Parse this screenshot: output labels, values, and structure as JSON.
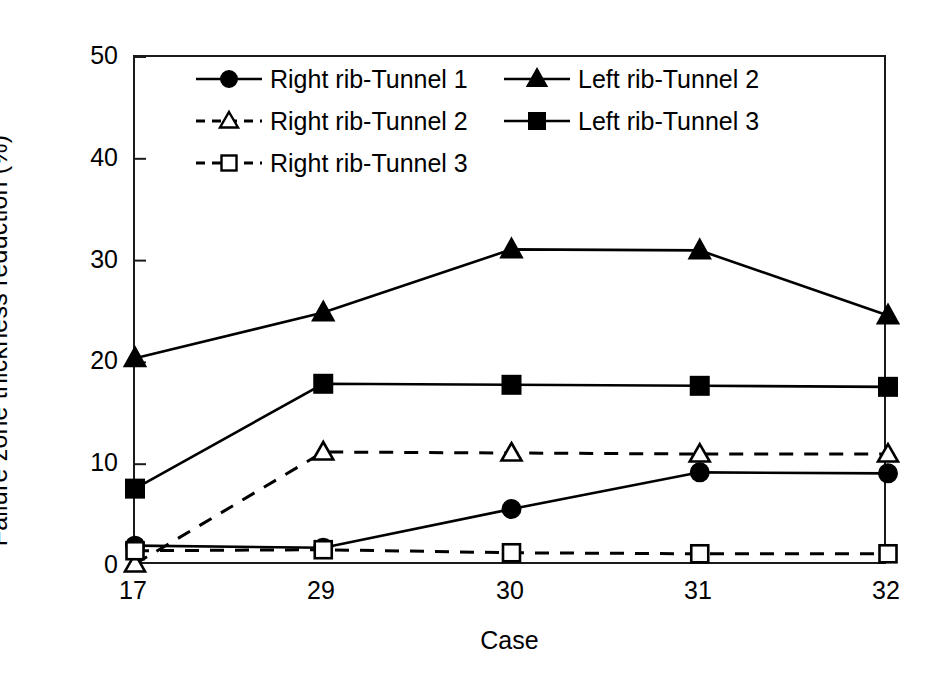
{
  "chart_data": {
    "type": "line",
    "title": "",
    "xlabel": "Case",
    "ylabel": "Failure zone thickness reduction  (%)",
    "categories": [
      "17",
      "29",
      "30",
      "31",
      "32"
    ],
    "xticklabels": [
      "17",
      "29",
      "30",
      "31",
      "32"
    ],
    "yticklabels": [
      "0",
      "10",
      "20",
      "30",
      "40",
      "50"
    ],
    "yticks": [
      0,
      10,
      20,
      30,
      40,
      50
    ],
    "ylim": [
      0,
      50
    ],
    "xlim": [
      0,
      4
    ],
    "grid": false,
    "legend_position": "upper-left-inside",
    "series": [
      {
        "name": "Right rib-Tunnel 1",
        "marker": "filled-circle",
        "linestyle": "solid",
        "color": "#000000",
        "values": [
          2.0,
          1.8,
          5.6,
          9.2,
          9.1
        ]
      },
      {
        "name": "Right rib-Tunnel 2",
        "marker": "open-triangle",
        "linestyle": "dashed",
        "color": "#000000",
        "values": [
          0.2,
          11.2,
          11.1,
          11.0,
          11.0
        ]
      },
      {
        "name": "Right rib-Tunnel 3",
        "marker": "open-square",
        "linestyle": "dashed",
        "color": "#000000",
        "values": [
          1.5,
          1.6,
          1.3,
          1.2,
          1.2
        ]
      },
      {
        "name": "Left rib-Tunnel 2",
        "marker": "filled-triangle",
        "linestyle": "solid",
        "color": "#000000",
        "values": [
          20.4,
          24.9,
          31.1,
          31.0,
          24.6
        ]
      },
      {
        "name": "Left rib-Tunnel 3",
        "marker": "filled-square",
        "linestyle": "solid",
        "color": "#000000",
        "values": [
          7.6,
          17.9,
          17.8,
          17.7,
          17.6
        ]
      }
    ]
  },
  "legend": {
    "entries": [
      {
        "label": "Right rib-Tunnel 1",
        "marker": "filled-circle",
        "linestyle": "solid",
        "col": 0,
        "row": 0
      },
      {
        "label": "Right rib-Tunnel 2",
        "marker": "open-triangle",
        "linestyle": "dashed",
        "col": 0,
        "row": 1
      },
      {
        "label": "Right rib-Tunnel 3",
        "marker": "open-square",
        "linestyle": "dashed",
        "col": 0,
        "row": 2
      },
      {
        "label": "Left rib-Tunnel 2",
        "marker": "filled-triangle",
        "linestyle": "solid",
        "col": 1,
        "row": 0
      },
      {
        "label": "Left rib-Tunnel 3",
        "marker": "filled-square",
        "linestyle": "solid",
        "col": 1,
        "row": 1
      }
    ]
  },
  "style": {
    "axis_color": "#1a1a1a",
    "line_color": "#000000",
    "background": "#ffffff"
  }
}
